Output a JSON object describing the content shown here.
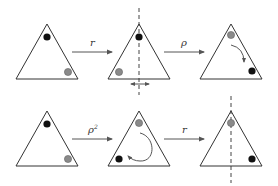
{
  "diagram": {
    "colors": {
      "black_dot": "#111111",
      "gray_dot": "#8a8a8a",
      "stroke": "#333333"
    },
    "rows": [
      {
        "triangles": [
          {
            "id": "t1",
            "dots": [
              {
                "pos": "top",
                "color": "black"
              },
              {
                "pos": "bottom-right",
                "color": "gray"
              }
            ],
            "axis": false
          },
          {
            "id": "t2",
            "dots": [
              {
                "pos": "top",
                "color": "black"
              },
              {
                "pos": "bottom-left",
                "color": "gray"
              }
            ],
            "axis": true,
            "flip_arrow": true
          },
          {
            "id": "t3",
            "dots": [
              {
                "pos": "top",
                "color": "gray"
              },
              {
                "pos": "bottom-right",
                "color": "black"
              }
            ],
            "rotation_arrow": "clockwise-small"
          }
        ],
        "arrows": [
          {
            "label": "r"
          },
          {
            "label": "ρ"
          }
        ]
      },
      {
        "triangles": [
          {
            "id": "t4",
            "dots": [
              {
                "pos": "top",
                "color": "black"
              },
              {
                "pos": "bottom-right",
                "color": "gray"
              }
            ]
          },
          {
            "id": "t5",
            "dots": [
              {
                "pos": "top",
                "color": "gray"
              },
              {
                "pos": "bottom-left",
                "color": "black"
              }
            ],
            "rotation_arrow": "clockwise-large"
          },
          {
            "id": "t6",
            "dots": [
              {
                "pos": "top",
                "color": "gray"
              },
              {
                "pos": "bottom-right",
                "color": "black"
              }
            ],
            "axis": true
          }
        ],
        "arrows": [
          {
            "label": "ρ",
            "superscript": "2"
          },
          {
            "label": "r"
          }
        ]
      }
    ]
  }
}
